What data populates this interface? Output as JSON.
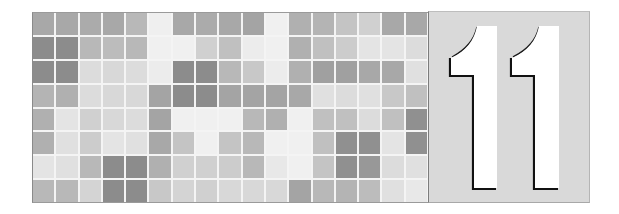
{
  "chapter": {
    "number": "11",
    "digits": [
      "1",
      "1"
    ]
  },
  "mosaic": {
    "columns": 17,
    "rows": 8,
    "grid_line_color": "#f4f4f4",
    "cells": [
      [
        "#a8a8a8",
        "#a8a8a8",
        "#ababab",
        "#a8a8a8",
        "#b8b8b8",
        "#efefef",
        "#a8a8a8",
        "#ababab",
        "#a8a8a8",
        "#a4a4a4",
        "#f0f0f0",
        "#b0b0b0",
        "#b4b4b4",
        "#c4c4c4",
        "#d0d0d0",
        "#a8a8a8",
        "#a8a8a8"
      ],
      [
        "#8c8c8c",
        "#8c8c8c",
        "#b8b8b8",
        "#bcbcbc",
        "#b8b8b8",
        "#f0f0f0",
        "#f0f0f0",
        "#d0d0d0",
        "#c0c0c0",
        "#ececec",
        "#f0f0f0",
        "#b0b0b0",
        "#c0c0c0",
        "#cccccc",
        "#e4e4e4",
        "#e4e4e4",
        "#dcdcdc"
      ],
      [
        "#8c8c8c",
        "#8c8c8c",
        "#dcdcdc",
        "#d8d8d8",
        "#dcdcdc",
        "#ececec",
        "#8c8c8c",
        "#8c8c8c",
        "#b8b8b8",
        "#c8c8c8",
        "#ececec",
        "#b0b0b0",
        "#a0a0a0",
        "#a0a0a0",
        "#a8a8a8",
        "#a8a8a8",
        "#e0e0e0"
      ],
      [
        "#b4b4b4",
        "#b0b0b0",
        "#dcdcdc",
        "#d8d8d8",
        "#d8d8d8",
        "#a4a4a4",
        "#8c8c8c",
        "#8c8c8c",
        "#a4a4a4",
        "#a4a4a4",
        "#a4a4a4",
        "#a8a8a8",
        "#e0e0e0",
        "#dcdcdc",
        "#e0e0e0",
        "#c8c8c8",
        "#c0c0c0"
      ],
      [
        "#b0b0b0",
        "#e4e4e4",
        "#d0d0d0",
        "#d8d8d8",
        "#dcdcdc",
        "#a4a4a4",
        "#f0f0f0",
        "#f0f0f0",
        "#f0f0f0",
        "#b8b8b8",
        "#b0b0b0",
        "#f0f0f0",
        "#c0c0c0",
        "#c0c0c0",
        "#dcdcdc",
        "#c0c0c0",
        "#909090"
      ],
      [
        "#b0b0b0",
        "#e0e0e0",
        "#cccccc",
        "#e4e4e4",
        "#e0e0e0",
        "#a8a8a8",
        "#c4c4c4",
        "#f0f0f0",
        "#c4c4c4",
        "#b8b8b8",
        "#f0f0f0",
        "#f0f0f0",
        "#c0c0c0",
        "#909090",
        "#909090",
        "#e4e4e4",
        "#909090"
      ],
      [
        "#e4e4e4",
        "#e0e0e0",
        "#b8b8b8",
        "#8c8c8c",
        "#8c8c8c",
        "#b0b0b0",
        "#d0d0d0",
        "#d0d0d0",
        "#cccccc",
        "#b8b8b8",
        "#e8e8e8",
        "#f0f0f0",
        "#c4c4c4",
        "#909090",
        "#989898",
        "#dcdcdc",
        "#e0e0e0"
      ],
      [
        "#b8b8b8",
        "#b8b8b8",
        "#d4d4d4",
        "#8c8c8c",
        "#8c8c8c",
        "#c8c8c8",
        "#d4d4d4",
        "#d0d0d0",
        "#d8d8d8",
        "#d8d8d8",
        "#d8d8d8",
        "#a4a4a4",
        "#b8b8b8",
        "#b4b4b4",
        "#bcbcbc",
        "#e0e0e0",
        "#e8e8e8"
      ]
    ]
  },
  "panel": {
    "background": "#d9d9d9",
    "digit_fill": "#ffffff",
    "digit_shadow": "#111111"
  }
}
